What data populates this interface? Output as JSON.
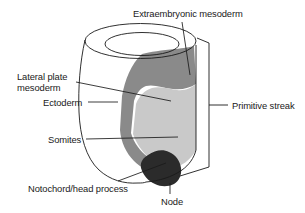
{
  "figure": {
    "kind": "embryo-fate-map-diagram",
    "background_color": "#ffffff",
    "outline_color": "#1a1a1a",
    "text_color": "#1a1a1a"
  },
  "labels": {
    "extraembryonic_mesoderm": "Extraembryonic mesoderm",
    "lateral_plate_line1": "Lateral plate",
    "lateral_plate_line2": "mesoderm",
    "ectoderm": "Ectoderm",
    "somites": "Somites",
    "notochord_head_process": "Notochord/head process",
    "node": "Node",
    "primitive_streak": "Primitive streak"
  },
  "regions": [
    {
      "name": "extraembryonic-mesoderm-region",
      "label": "Extraembryonic mesoderm",
      "fill": "#8a8a8a",
      "tone": "medium-dark-gray"
    },
    {
      "name": "lateral-plate-mesoderm-region",
      "label": "Lateral plate mesoderm",
      "fill": "#8a8a8a",
      "tone": "medium-dark-gray"
    },
    {
      "name": "somites-region",
      "label": "Somites",
      "fill": "#c9c9c9",
      "tone": "light-gray"
    },
    {
      "name": "node-region",
      "label": "Node",
      "fill": "#2b2b2b",
      "tone": "near-black"
    },
    {
      "name": "ectoderm-region",
      "label": "Ectoderm",
      "fill": "#ffffff",
      "tone": "white"
    }
  ],
  "annotations": {
    "primitive_streak_bracket": "Primitive streak",
    "bracket_side": "right"
  }
}
